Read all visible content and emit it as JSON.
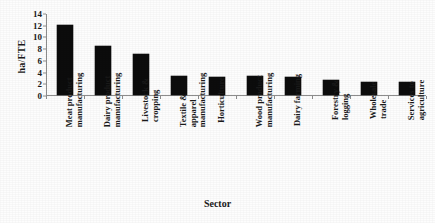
{
  "chart_data": {
    "type": "bar",
    "title": "",
    "xlabel": "Sector",
    "ylabel": "ha/FTE",
    "ylim": [
      0,
      14
    ],
    "ytick_step": 2,
    "yticks": [
      "0",
      "2",
      "4",
      "6",
      "8",
      "10",
      "12",
      "14"
    ],
    "grid": false,
    "legend": null,
    "bar_color": "#0c0c0c",
    "axis_color": "#8d8d8d",
    "categories": [
      "Meat product manufacturing",
      "Dairy product manufacturing",
      "Livestock & cropping",
      "Textile & apparel manufacturing",
      "Horticulture",
      "Wood product manufacturing",
      "Dairy farming",
      "Forestry & logging",
      "Wholesale trade",
      "Services to agriculture"
    ],
    "category_lines": [
      [
        "Meat product",
        "manufacturing"
      ],
      [
        "Dairy product",
        "manufacturing"
      ],
      [
        "Livestock &",
        "cropping"
      ],
      [
        "Textile &",
        "apparel",
        "manufacturing"
      ],
      [
        "Horticulture",
        ""
      ],
      [
        "Wood product",
        "manufacturing"
      ],
      [
        "Dairy farming",
        ""
      ],
      [
        "Forestry &",
        "logging"
      ],
      [
        "Wholesale",
        "trade"
      ],
      [
        "Services to",
        "agriculture"
      ]
    ],
    "values": [
      12.0,
      8.4,
      7.0,
      3.2,
      3.1,
      3.2,
      3.0,
      2.5,
      2.3,
      2.2
    ]
  }
}
